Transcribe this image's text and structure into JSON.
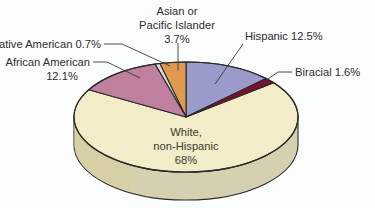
{
  "background_color": "#fbfcfc",
  "text_color": "#2e2e2e",
  "chart_data": {
    "type": "pie",
    "title": "",
    "subtitle": "",
    "xlabel": "",
    "ylabel": "",
    "legend_position": "none",
    "style": "3d-pie",
    "labels_inline": true,
    "categories": [
      "Hispanic",
      "Biracial",
      "White, non-Hispanic",
      "African American",
      "Native American",
      "Asian or Pacific Islander"
    ],
    "values": [
      12.5,
      1.6,
      68,
      12.1,
      0.7,
      3.7
    ],
    "units": "%",
    "colors": [
      "#9a9acb",
      "#7a1030",
      "#f2edc8",
      "#bf7f9f",
      "#dcdcdc",
      "#e09a50"
    ],
    "slices": [
      {
        "name": "Hispanic",
        "value": 12.5,
        "color": "#9a9acb",
        "label": "Hispanic 12.5%"
      },
      {
        "name": "Biracial",
        "value": 1.6,
        "color": "#7a1030",
        "label": "Biracial 1.6%"
      },
      {
        "name": "White, non-Hispanic",
        "value": 68,
        "color": "#f2edc8",
        "label": "White, non-Hispanic 68%"
      },
      {
        "name": "African American",
        "value": 12.1,
        "color": "#bf7f9f",
        "label": "African American 12.1%"
      },
      {
        "name": "Native American",
        "value": 0.7,
        "color": "#dcdcdc",
        "label": "Native American 0.7%"
      },
      {
        "name": "Asian or Pacific Islander",
        "value": 3.7,
        "color": "#e09a50",
        "label": "Asian or Pacific Islander 3.7%"
      }
    ]
  },
  "labels": {
    "asian_line1": "Asian or",
    "asian_line2": "Pacific Islander",
    "asian_line3": "3.7%",
    "native_american": "Native American 0.7%",
    "african_american_line1": "African American",
    "african_american_line2": "12.1%",
    "hispanic": "Hispanic 12.5%",
    "biracial": "Biracial 1.6%",
    "white_line1": "White,",
    "white_line2": "non-Hispanic",
    "white_line3": "68%"
  }
}
